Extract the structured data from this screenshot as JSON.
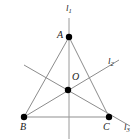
{
  "figure": {
    "kind": "euclidean-geometry-diagram",
    "canvas": {
      "width": 140,
      "height": 140
    },
    "colors": {
      "background": "#ffffff",
      "stroke": "#8c8c8c",
      "stroke_light": "#b5b5b5",
      "point_fill": "#000000",
      "label_text": "#1a1a1a"
    },
    "points": [
      {
        "id": "A",
        "label": "A",
        "x": 69,
        "y": 37,
        "label_x": 57,
        "label_y": 30,
        "radius": 3.2
      },
      {
        "id": "B",
        "label": "B",
        "x": 24,
        "y": 117,
        "label_x": 20,
        "label_y": 122,
        "radius": 3.2
      },
      {
        "id": "C",
        "label": "C",
        "x": 109,
        "y": 117,
        "label_x": 103,
        "label_y": 122,
        "radius": 3.2
      },
      {
        "id": "O",
        "label": "O",
        "x": 68,
        "y": 90,
        "label_x": 72,
        "label_y": 72,
        "radius": 3.2
      }
    ],
    "lines": [
      {
        "id": "l1",
        "label": "l",
        "subscript": "1",
        "label_x": 66,
        "label_y": 4,
        "x1": 69,
        "y1": 18,
        "x2": 69,
        "y2": 139,
        "note": "vertical line through A, O and midpoint of BC"
      },
      {
        "id": "l2",
        "label": "l",
        "subscript": "2",
        "label_x": 108,
        "label_y": 57,
        "x1": 24,
        "y1": 117,
        "x2": 119,
        "y2": 60,
        "note": "line from B through O extended up-right"
      },
      {
        "id": "l3",
        "label": "l",
        "subscript": "3",
        "label_x": 124,
        "label_y": 123,
        "x1": 24,
        "y1": 65,
        "x2": 130,
        "y2": 126,
        "note": "line from upper-left through O and C extended"
      }
    ],
    "segments": [
      {
        "id": "AB",
        "x1": 69,
        "y1": 37,
        "x2": 24,
        "y2": 117
      },
      {
        "id": "AC",
        "x1": 69,
        "y1": 37,
        "x2": 109,
        "y2": 117
      },
      {
        "id": "BC",
        "x1": 24,
        "y1": 117,
        "x2": 109,
        "y2": 117
      }
    ]
  }
}
